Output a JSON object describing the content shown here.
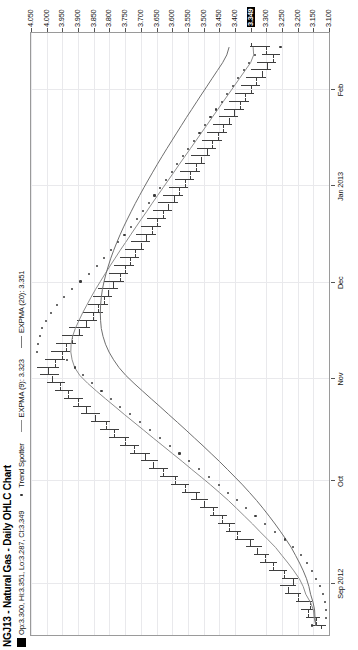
{
  "header": {
    "title": "NGJ13 - Natural Gas - Daily OHLC Chart",
    "quote_box_marker": "ohlc-swatch",
    "quote_text": "Op:3.300, Hi:3.351, Lo:3.287, Cl:3.349",
    "legend": [
      {
        "marker": "dot",
        "label": "Trend Spotter"
      },
      {
        "marker": "line",
        "label": "EXPMA (9): 3.323"
      },
      {
        "marker": "line",
        "label": "EXPMA (20): 3.351"
      }
    ]
  },
  "quote": {
    "symbol": "NGJ13",
    "name": "Natural Gas",
    "open": "3.300",
    "high": "3.351",
    "low": "3.287",
    "close": "3.349",
    "expma9": "3.323",
    "expma20": "3.351"
  },
  "colors": {
    "bar": "#3f3f3f",
    "expma9": "#8d8d8d",
    "expma20": "#6f6f6f",
    "trend_spotter": "#3b3b3b",
    "grid": "#e9e9ec",
    "frame": "#9a9a9a",
    "highlight_bg": "#000000",
    "highlight_fg": "#ffffff"
  },
  "chart_data": {
    "type": "line",
    "chart_kind": "ohlc-bar",
    "title": "NGJ13 - Natural Gas - Daily OHLC Chart",
    "xlabel": "",
    "ylabel": "",
    "grid": true,
    "legend_position": "top-left",
    "ylim": [
      3.1,
      4.05
    ],
    "y_ticks": [
      "4.050",
      "4.000",
      "3.950",
      "3.900",
      "3.850",
      "3.800",
      "3.750",
      "3.700",
      "3.650",
      "3.600",
      "3.550",
      "3.500",
      "3.450",
      "3.400",
      "3.349",
      "3.300",
      "3.250",
      "3.200",
      "3.150",
      "3.100"
    ],
    "y_tick_values": [
      4.05,
      4.0,
      3.95,
      3.9,
      3.85,
      3.8,
      3.75,
      3.7,
      3.65,
      3.6,
      3.55,
      3.5,
      3.45,
      3.4,
      3.349,
      3.3,
      3.25,
      3.2,
      3.15,
      3.1
    ],
    "y_highlight": "3.349",
    "x_ticks": [
      "Sep 2012",
      "Oct",
      "Nov",
      "Dec",
      "Jan 2013",
      "Feb"
    ],
    "x_tick_positions": [
      0.085,
      0.255,
      0.425,
      0.585,
      0.745,
      0.905
    ],
    "ohlc": [
      {
        "o": 3.125,
        "h": 3.155,
        "l": 3.11,
        "c": 3.142
      },
      {
        "o": 3.142,
        "h": 3.175,
        "l": 3.13,
        "c": 3.168
      },
      {
        "o": 3.168,
        "h": 3.19,
        "l": 3.15,
        "c": 3.16
      },
      {
        "o": 3.16,
        "h": 3.205,
        "l": 3.155,
        "c": 3.198
      },
      {
        "o": 3.198,
        "h": 3.24,
        "l": 3.19,
        "c": 3.232
      },
      {
        "o": 3.232,
        "h": 3.255,
        "l": 3.205,
        "c": 3.215
      },
      {
        "o": 3.215,
        "h": 3.25,
        "l": 3.2,
        "c": 3.245
      },
      {
        "o": 3.245,
        "h": 3.29,
        "l": 3.235,
        "c": 3.28
      },
      {
        "o": 3.28,
        "h": 3.32,
        "l": 3.265,
        "c": 3.305
      },
      {
        "o": 3.305,
        "h": 3.34,
        "l": 3.29,
        "c": 3.33
      },
      {
        "o": 3.33,
        "h": 3.365,
        "l": 3.315,
        "c": 3.352
      },
      {
        "o": 3.352,
        "h": 3.4,
        "l": 3.34,
        "c": 3.392
      },
      {
        "o": 3.392,
        "h": 3.43,
        "l": 3.38,
        "c": 3.418
      },
      {
        "o": 3.418,
        "h": 3.455,
        "l": 3.4,
        "c": 3.44
      },
      {
        "o": 3.44,
        "h": 3.48,
        "l": 3.425,
        "c": 3.47
      },
      {
        "o": 3.47,
        "h": 3.51,
        "l": 3.455,
        "c": 3.498
      },
      {
        "o": 3.498,
        "h": 3.54,
        "l": 3.485,
        "c": 3.525
      },
      {
        "o": 3.525,
        "h": 3.57,
        "l": 3.51,
        "c": 3.56
      },
      {
        "o": 3.56,
        "h": 3.605,
        "l": 3.545,
        "c": 3.592
      },
      {
        "o": 3.592,
        "h": 3.64,
        "l": 3.58,
        "c": 3.628
      },
      {
        "o": 3.628,
        "h": 3.675,
        "l": 3.612,
        "c": 3.66
      },
      {
        "o": 3.66,
        "h": 3.7,
        "l": 3.645,
        "c": 3.688
      },
      {
        "o": 3.688,
        "h": 3.735,
        "l": 3.672,
        "c": 3.722
      },
      {
        "o": 3.722,
        "h": 3.768,
        "l": 3.705,
        "c": 3.752
      },
      {
        "o": 3.752,
        "h": 3.8,
        "l": 3.738,
        "c": 3.785
      },
      {
        "o": 3.785,
        "h": 3.83,
        "l": 3.768,
        "c": 3.812
      },
      {
        "o": 3.812,
        "h": 3.858,
        "l": 3.798,
        "c": 3.845
      },
      {
        "o": 3.845,
        "h": 3.89,
        "l": 3.83,
        "c": 3.875
      },
      {
        "o": 3.875,
        "h": 3.915,
        "l": 3.858,
        "c": 3.9
      },
      {
        "o": 3.9,
        "h": 3.945,
        "l": 3.885,
        "c": 3.932
      },
      {
        "o": 3.932,
        "h": 3.975,
        "l": 3.915,
        "c": 3.958
      },
      {
        "o": 3.958,
        "h": 4.0,
        "l": 3.94,
        "c": 3.982
      },
      {
        "o": 3.982,
        "h": 4.02,
        "l": 3.96,
        "c": 3.995
      },
      {
        "o": 3.995,
        "h": 4.03,
        "l": 3.962,
        "c": 3.975
      },
      {
        "o": 3.975,
        "h": 4.005,
        "l": 3.94,
        "c": 3.952
      },
      {
        "o": 3.952,
        "h": 3.985,
        "l": 3.925,
        "c": 3.94
      },
      {
        "o": 3.94,
        "h": 3.97,
        "l": 3.905,
        "c": 3.918
      },
      {
        "o": 3.918,
        "h": 3.95,
        "l": 3.885,
        "c": 3.898
      },
      {
        "o": 3.898,
        "h": 3.93,
        "l": 3.862,
        "c": 3.875
      },
      {
        "o": 3.875,
        "h": 3.905,
        "l": 3.84,
        "c": 3.852
      },
      {
        "o": 3.852,
        "h": 3.885,
        "l": 3.82,
        "c": 3.838
      },
      {
        "o": 3.838,
        "h": 3.87,
        "l": 3.805,
        "c": 3.818
      },
      {
        "o": 3.818,
        "h": 3.852,
        "l": 3.79,
        "c": 3.805
      },
      {
        "o": 3.805,
        "h": 3.838,
        "l": 3.772,
        "c": 3.788
      },
      {
        "o": 3.788,
        "h": 3.818,
        "l": 3.755,
        "c": 3.768
      },
      {
        "o": 3.768,
        "h": 3.8,
        "l": 3.74,
        "c": 3.752
      },
      {
        "o": 3.752,
        "h": 3.785,
        "l": 3.722,
        "c": 3.735
      },
      {
        "o": 3.735,
        "h": 3.768,
        "l": 3.705,
        "c": 3.718
      },
      {
        "o": 3.718,
        "h": 3.75,
        "l": 3.688,
        "c": 3.7
      },
      {
        "o": 3.7,
        "h": 3.732,
        "l": 3.67,
        "c": 3.682
      },
      {
        "o": 3.682,
        "h": 3.715,
        "l": 3.652,
        "c": 3.665
      },
      {
        "o": 3.665,
        "h": 3.698,
        "l": 3.635,
        "c": 3.648
      },
      {
        "o": 3.648,
        "h": 3.68,
        "l": 3.618,
        "c": 3.63
      },
      {
        "o": 3.63,
        "h": 3.662,
        "l": 3.6,
        "c": 3.612
      },
      {
        "o": 3.612,
        "h": 3.645,
        "l": 3.582,
        "c": 3.595
      },
      {
        "o": 3.595,
        "h": 3.628,
        "l": 3.565,
        "c": 3.578
      },
      {
        "o": 3.578,
        "h": 3.61,
        "l": 3.548,
        "c": 3.56
      },
      {
        "o": 3.56,
        "h": 3.592,
        "l": 3.53,
        "c": 3.542
      },
      {
        "o": 3.542,
        "h": 3.575,
        "l": 3.512,
        "c": 3.525
      },
      {
        "o": 3.525,
        "h": 3.558,
        "l": 3.495,
        "c": 3.508
      },
      {
        "o": 3.508,
        "h": 3.54,
        "l": 3.478,
        "c": 3.49
      },
      {
        "o": 3.49,
        "h": 3.522,
        "l": 3.46,
        "c": 3.472
      },
      {
        "o": 3.472,
        "h": 3.505,
        "l": 3.442,
        "c": 3.455
      },
      {
        "o": 3.455,
        "h": 3.488,
        "l": 3.425,
        "c": 3.438
      },
      {
        "o": 3.438,
        "h": 3.47,
        "l": 3.408,
        "c": 3.42
      },
      {
        "o": 3.42,
        "h": 3.452,
        "l": 3.39,
        "c": 3.402
      },
      {
        "o": 3.402,
        "h": 3.435,
        "l": 3.372,
        "c": 3.385
      },
      {
        "o": 3.385,
        "h": 3.418,
        "l": 3.355,
        "c": 3.368
      },
      {
        "o": 3.368,
        "h": 3.4,
        "l": 3.338,
        "c": 3.35
      },
      {
        "o": 3.35,
        "h": 3.382,
        "l": 3.32,
        "c": 3.332
      },
      {
        "o": 3.332,
        "h": 3.365,
        "l": 3.302,
        "c": 3.315
      },
      {
        "o": 3.315,
        "h": 3.348,
        "l": 3.285,
        "c": 3.298
      },
      {
        "o": 3.298,
        "h": 3.33,
        "l": 3.268,
        "c": 3.28
      },
      {
        "o": 3.28,
        "h": 3.315,
        "l": 3.255,
        "c": 3.3
      },
      {
        "o": 3.3,
        "h": 3.351,
        "l": 3.287,
        "c": 3.349
      }
    ]
  }
}
